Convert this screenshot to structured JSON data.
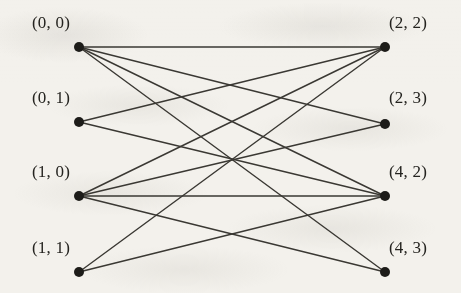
{
  "figure": {
    "type": "bipartite-graph-diagram",
    "background_color": "#f3f1ec",
    "edge_color": "#3a3833",
    "node_color": "#1d1c19",
    "label_color": "#24231f",
    "node_radius": 5,
    "edge_width": 1.4,
    "width": 461,
    "height": 293
  },
  "nodes": {
    "left": [
      {
        "id": "L0",
        "label": "(0, 0)",
        "x": 79,
        "y": 47,
        "label_x": 32,
        "label_y": 14,
        "degree": 4
      },
      {
        "id": "L1",
        "label": "(0, 1)",
        "x": 79,
        "y": 122,
        "label_x": 32,
        "label_y": 89,
        "degree": 2
      },
      {
        "id": "L2",
        "label": "(1, 0)",
        "x": 79,
        "y": 196,
        "label_x": 32,
        "label_y": 163,
        "degree": 4
      },
      {
        "id": "L3",
        "label": "(1, 1)",
        "x": 79,
        "y": 272,
        "label_x": 32,
        "label_y": 239,
        "degree": 2
      }
    ],
    "right": [
      {
        "id": "R0",
        "label": "(2, 2)",
        "x": 385,
        "y": 47,
        "label_x": 389,
        "label_y": 14,
        "degree": 4
      },
      {
        "id": "R1",
        "label": "(2, 3)",
        "x": 385,
        "y": 124,
        "label_x": 389,
        "label_y": 89,
        "degree": 2
      },
      {
        "id": "R2",
        "label": "(4, 2)",
        "x": 385,
        "y": 196,
        "label_x": 389,
        "label_y": 163,
        "degree": 4
      },
      {
        "id": "R3",
        "label": "(4, 3)",
        "x": 385,
        "y": 272,
        "label_x": 389,
        "label_y": 239,
        "degree": 2
      }
    ]
  },
  "edges": [
    {
      "from": "L0",
      "to": "R0"
    },
    {
      "from": "L0",
      "to": "R1"
    },
    {
      "from": "L0",
      "to": "R2"
    },
    {
      "from": "L0",
      "to": "R3"
    },
    {
      "from": "L1",
      "to": "R0"
    },
    {
      "from": "L1",
      "to": "R2"
    },
    {
      "from": "L2",
      "to": "R0"
    },
    {
      "from": "L2",
      "to": "R1"
    },
    {
      "from": "L2",
      "to": "R2"
    },
    {
      "from": "L2",
      "to": "R3"
    },
    {
      "from": "L3",
      "to": "R0"
    },
    {
      "from": "L3",
      "to": "R2"
    }
  ]
}
